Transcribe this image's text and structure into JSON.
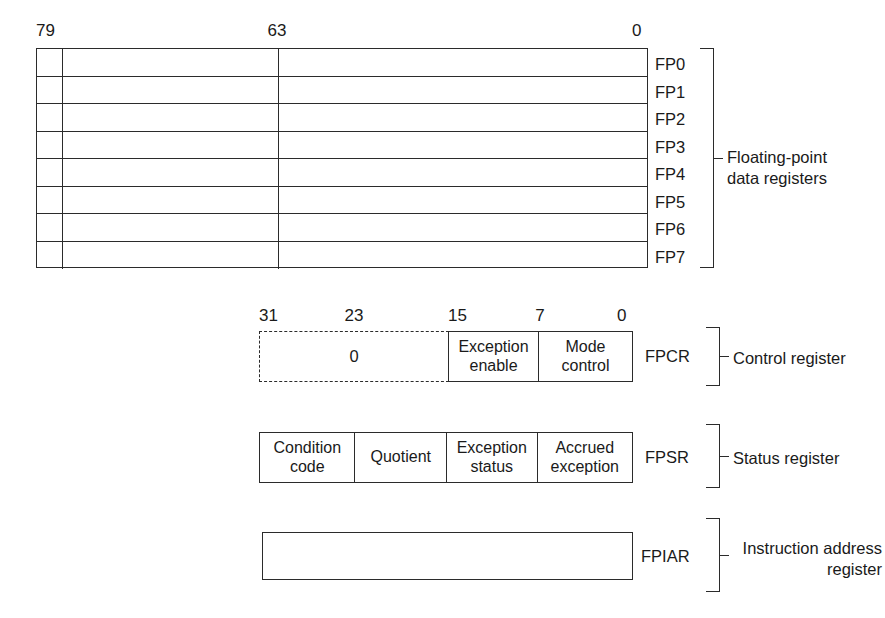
{
  "diagram": {
    "line_color": "#2b2b2b",
    "text_color": "#1a1a1a",
    "background": "#ffffff"
  },
  "fp_data_registers": {
    "bit_labels": {
      "msb": "79",
      "mid": "63",
      "lsb": "0"
    },
    "registers": [
      {
        "name": "FP0"
      },
      {
        "name": "FP1"
      },
      {
        "name": "FP2"
      },
      {
        "name": "FP3"
      },
      {
        "name": "FP4"
      },
      {
        "name": "FP5"
      },
      {
        "name": "FP6"
      },
      {
        "name": "FP7"
      }
    ],
    "group_label": "Floating-point\ndata registers"
  },
  "control_register": {
    "bit_labels": {
      "b31": "31",
      "b23": "23",
      "b15": "15",
      "b7": "7",
      "b0": "0"
    },
    "reserved_field": "0",
    "fields": [
      {
        "label": "Exception\nenable"
      },
      {
        "label": "Mode\ncontrol"
      }
    ],
    "register_name": "FPCR",
    "description": "Control register"
  },
  "status_register": {
    "fields": [
      {
        "label": "Condition\ncode"
      },
      {
        "label": "Quotient"
      },
      {
        "label": "Exception\nstatus"
      },
      {
        "label": "Accrued\nexception"
      }
    ],
    "register_name": "FPSR",
    "description": "Status register"
  },
  "instruction_address_register": {
    "register_name": "FPIAR",
    "description": "Instruction address\nregister"
  }
}
